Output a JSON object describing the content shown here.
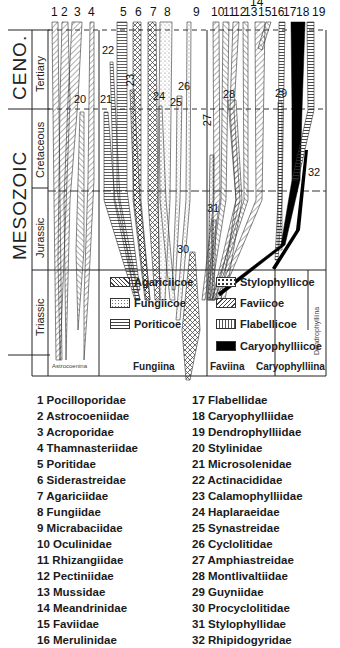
{
  "chart": {
    "eras": [
      {
        "label": "CENO."
      },
      {
        "label": "MESOZOIC"
      }
    ],
    "periods": [
      {
        "label": "Tertiary"
      },
      {
        "label": "Cretaceous"
      },
      {
        "label": "Jurassic"
      },
      {
        "label": "Triassic"
      }
    ],
    "column_numbers": [
      "1",
      "2",
      "3",
      "4",
      "5",
      "6",
      "7",
      "8",
      "9",
      "10",
      "11",
      "12",
      "13",
      "14",
      "15",
      "16",
      "17",
      "18",
      "19"
    ],
    "inline_labels": [
      "20",
      "21",
      "22",
      "23",
      "24",
      "25",
      "26",
      "27",
      "28",
      "29",
      "30",
      "31",
      "32"
    ],
    "legend": [
      {
        "label": "Agariciicoe",
        "pattern": "crosshatch"
      },
      {
        "label": "Fungiicoe",
        "pattern": "stipple"
      },
      {
        "label": "Poriticoe",
        "pattern": "horizontal-lines"
      },
      {
        "label": "Stylophyllicoe",
        "pattern": "dotted-blocks"
      },
      {
        "label": "Faviicoe",
        "pattern": "diagonal-lines"
      },
      {
        "label": "Flabellicoe",
        "pattern": "ladder"
      },
      {
        "label": "Caryophylliicoe",
        "pattern": "solid-black"
      }
    ],
    "suborders": [
      {
        "label": "Astrocoenina"
      },
      {
        "label": "Fungiina"
      },
      {
        "label": "Faviina"
      },
      {
        "label": "Caryophylliina"
      },
      {
        "label": "Dendrophylliina"
      }
    ]
  },
  "families_left": [
    "1 Pocilloporidae",
    "2 Astrocoeniidae",
    "3 Acroporidae",
    "4 Thamnasteriidae",
    "5 Poritidae",
    "6 Siderastreidae",
    "7 Agariciidae",
    "8 Fungiidae",
    "9 Micrabaciidae",
    "10 Oculinidae",
    "11 Rhizangiidae",
    "12 Pectiniidae",
    "13 Mussidae",
    "14 Meandrinidae",
    "15 Faviidae",
    "16 Merulinidae"
  ],
  "families_right": [
    "17 Flabellidae",
    "18 Caryophylliidae",
    "19 Dendrophylliidae",
    "20 Stylinidae",
    "21 Microsolenidae",
    "22 Actinacididae",
    "23 Calamophylliidae",
    "24 Haplaraeidae",
    "25 Synastreidae",
    "26 Cyclolitidae",
    "27 Amphiastreidae",
    "28 Montlivaltiidae",
    "29 Guyniidae",
    "30 Procyclolitidae",
    "31 Stylophyllidae",
    "32 Rhipidogyridae"
  ]
}
